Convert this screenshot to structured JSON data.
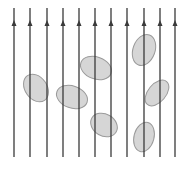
{
  "diagram": {
    "colors": {
      "background": "#ffffff",
      "line": "#3a3a3a",
      "ellipse_fill": "#d6d6d6",
      "ellipse_stroke": "#9a9a9a"
    },
    "lines": {
      "x": [
        14,
        30,
        47,
        63,
        79,
        95,
        111,
        127,
        144,
        160,
        175
      ],
      "y_top": 8,
      "y_bottom": 157,
      "arrow_y": 24,
      "arrow_direction": "up"
    },
    "ellipses": [
      {
        "cx": 36,
        "cy": 88,
        "rx": 11,
        "ry": 15,
        "rotate": -35
      },
      {
        "cx": 72,
        "cy": 97,
        "rx": 16,
        "ry": 11,
        "rotate": 20
      },
      {
        "cx": 96,
        "cy": 68,
        "rx": 16,
        "ry": 11,
        "rotate": 20
      },
      {
        "cx": 104,
        "cy": 125,
        "rx": 14,
        "ry": 11,
        "rotate": 30
      },
      {
        "cx": 144,
        "cy": 50,
        "rx": 11,
        "ry": 16,
        "rotate": 20
      },
      {
        "cx": 157,
        "cy": 93,
        "rx": 9,
        "ry": 15,
        "rotate": 40
      },
      {
        "cx": 144,
        "cy": 137,
        "rx": 10,
        "ry": 15,
        "rotate": 15
      }
    ]
  }
}
